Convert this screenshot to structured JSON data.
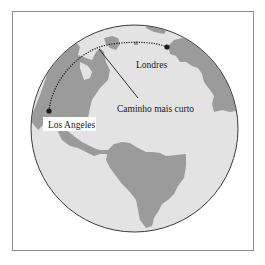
{
  "figure": {
    "type": "globe-great-circle-diagram",
    "colors": {
      "ocean": "#e3e3e3",
      "land": "#9b9b9b",
      "outline": "#3a3a3a",
      "frame": "#8c8c8c",
      "route": "#1a1a1a",
      "label_bg": "#ffffff"
    },
    "labels": {
      "origin": "Los Angeles",
      "destination": "Londres",
      "route": "Caminho mais curto"
    },
    "points": [
      {
        "name": "Los Angeles",
        "x": 49,
        "y": 111
      },
      {
        "name": "Londres",
        "x": 167,
        "y": 47
      }
    ]
  }
}
